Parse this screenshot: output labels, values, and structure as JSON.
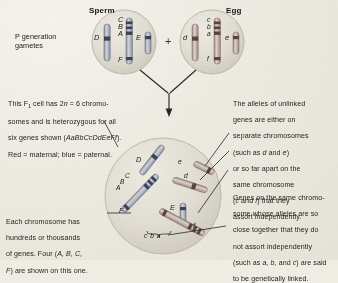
{
  "figure": {
    "title_sperm": "Sperm",
    "title_egg": "Egg",
    "plus_sign": "+",
    "p_generation_label": "P generation\ngametes"
  },
  "callouts": {
    "f1_cell": {
      "line1": "This F",
      "sub": "1",
      "line1b": " cell has 2",
      "n_ital": "n",
      "line1c": " = 6 chromo-",
      "line2": "somes and is heterozygous for all",
      "line3a": "six genes shown (",
      "genotype": "AaBbCcDdEeFf",
      "line3b": ").",
      "line4": "Red = maternal; blue = paternal."
    },
    "each_chromosome": {
      "line1": "Each chromosome has",
      "line2": "hundreds or thousands",
      "line3a": "of genes. Four (",
      "genes_ital": "A, B, C,",
      "line4a": "F",
      "line4b": ") are shown on this one."
    },
    "unlinked": {
      "line1": "The alleles of unlinked",
      "line2": "genes are either on",
      "line3": "separate chromosomes",
      "line4a": "(such as ",
      "line4_d": "d",
      "line4b": " and ",
      "line4_e": "e",
      "line4c": ")",
      "line5": "or so far apart on the",
      "line6": "same chromosome",
      "line7a": "(",
      "line7_c": "c",
      "line7b": " and ",
      "line7_f": "f",
      "line7c": ")  that they",
      "line8": "assort independently."
    },
    "linked": {
      "line1": "Genes on the same chromo-",
      "line2": "some whose alleles are so",
      "line3": "close together that they do",
      "line4": "not assort independently",
      "line5a": "(such as ",
      "line5_a": "a, b,",
      "line5b": " and ",
      "line5_c": "c",
      "line5c": ") are said",
      "line6": "to be genetically linked."
    }
  },
  "sperm_cell": {
    "allele_labels": [
      "D",
      "C",
      "B",
      "A",
      "E",
      "F"
    ]
  },
  "egg_cell": {
    "allele_labels": [
      "d",
      "c",
      "b",
      "a",
      "e",
      "f"
    ]
  },
  "f1_cell": {
    "allele_labels": [
      "D",
      "C",
      "B",
      "A",
      "E",
      "F",
      "e",
      "d",
      "f",
      "c b a"
    ]
  },
  "colors": {
    "paper": "#efece4",
    "paternal_blue": "#4a5d82",
    "maternal_red": "#9c4a46",
    "chromosome_body": "#cfcabe",
    "chromosome_outline": "#6d665c",
    "cell_fill": "#dedacf",
    "cell_outline": "#9a948a",
    "leader_line": "#2e2a26",
    "text": "#211d1a"
  }
}
